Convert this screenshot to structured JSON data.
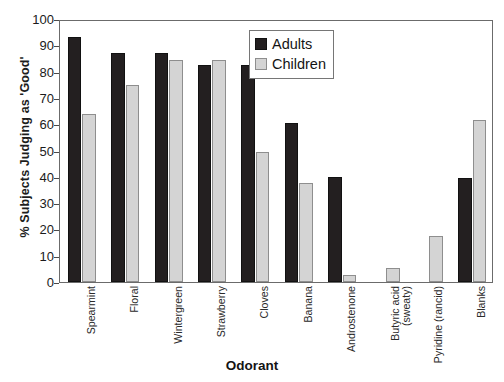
{
  "chart_data": {
    "type": "bar",
    "title": "",
    "xlabel": "Odorant",
    "ylabel": "% Subjects Judging as 'Good'",
    "ylim": [
      0,
      100
    ],
    "yticks": [
      0,
      10,
      20,
      30,
      40,
      50,
      60,
      70,
      80,
      90,
      100
    ],
    "grid": false,
    "legend_position": "top-right",
    "categories": [
      "Spearmint",
      "Floral",
      "Wintergreen",
      "Strawberry",
      "Cloves",
      "Banana",
      "Androstenone",
      "Butyric acid\n(sweaty)",
      "Pyridine (rancid)",
      "Blanks"
    ],
    "series": [
      {
        "name": "Adults",
        "color": "#231f20",
        "values": [
          93,
          87,
          87,
          82.5,
          82.5,
          60.5,
          40,
          0,
          0,
          39.5
        ]
      },
      {
        "name": "Children",
        "color": "#d4d4d4",
        "values": [
          64,
          75,
          84.5,
          84.5,
          49.5,
          37.5,
          2.5,
          5.5,
          17.5,
          61.5
        ]
      }
    ]
  },
  "legend": {
    "items": [
      {
        "label": "Adults",
        "swatch": "black-square-swatch"
      },
      {
        "label": "Children",
        "swatch": "gray-square-swatch"
      }
    ]
  },
  "axes": {
    "y_title": "% Subjects Judging as 'Good'",
    "x_title": "Odorant",
    "y_tick_labels": [
      "100",
      "90",
      "80",
      "70",
      "60",
      "50",
      "40",
      "30",
      "20",
      "10",
      "0"
    ]
  }
}
